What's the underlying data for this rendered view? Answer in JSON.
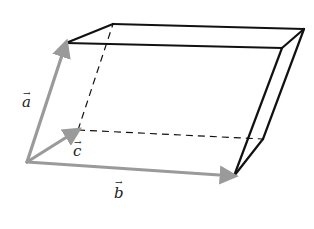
{
  "figure": {
    "width": 314,
    "height": 229
  },
  "colors": {
    "background": "#ffffff",
    "edge": "#111111",
    "vector": "#9a9a9a",
    "label": "#222222"
  },
  "vertices": {
    "O": [
      27,
      162
    ],
    "A": [
      66,
      43
    ],
    "B": [
      234,
      176
    ],
    "C": [
      78,
      130
    ],
    "AC": [
      113,
      24
    ],
    "AB": [
      282,
      48
    ],
    "BC": [
      263,
      139
    ],
    "ABC": [
      304,
      29
    ]
  },
  "vectors": [
    {
      "name": "a",
      "label": "a",
      "from": "O",
      "to": "A",
      "label_pos": [
        22,
        107
      ]
    },
    {
      "name": "b",
      "label": "b",
      "from": "O",
      "to": "B",
      "label_pos": [
        114,
        198
      ]
    },
    {
      "name": "c",
      "label": "c",
      "from": "O",
      "to": "C",
      "label_pos": [
        73,
        156
      ]
    }
  ],
  "edges": {
    "solid": [
      [
        "A",
        "AC"
      ],
      [
        "AC",
        "ABC"
      ],
      [
        "A",
        "AB"
      ],
      [
        "AB",
        "ABC"
      ],
      [
        "AB",
        "B"
      ],
      [
        "ABC",
        "BC"
      ],
      [
        "BC",
        "B"
      ]
    ],
    "dashed": [
      [
        "C",
        "AC"
      ],
      [
        "C",
        "BC"
      ]
    ]
  },
  "labels": {
    "a": "a",
    "b": "b",
    "c": "c",
    "arrow": "→"
  }
}
